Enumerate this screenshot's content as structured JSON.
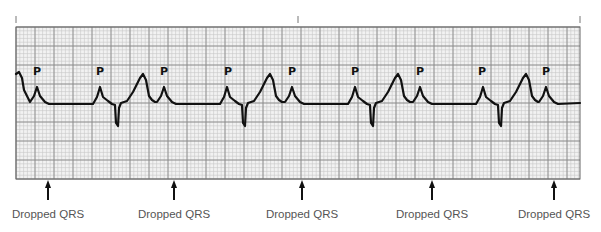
{
  "figure": {
    "p_wave_label": "P",
    "annotation_label": "Dropped QRS"
  },
  "strip": {
    "grid": {
      "x0": 16,
      "y0": 27,
      "x1": 580,
      "y1": 179,
      "minor": 3.8,
      "major": 19
    },
    "top_ticks_x": [
      16,
      298,
      580
    ],
    "p_labels": [
      {
        "x": 37,
        "text": "P"
      },
      {
        "x": 100,
        "text": "P"
      },
      {
        "x": 164,
        "text": "P"
      },
      {
        "x": 228,
        "text": "P"
      },
      {
        "x": 292,
        "text": "P"
      },
      {
        "x": 355,
        "text": "P"
      },
      {
        "x": 420,
        "text": "P"
      },
      {
        "x": 482,
        "text": "P"
      },
      {
        "x": 546,
        "text": "P"
      }
    ],
    "dropped_qrs": [
      {
        "x": 48,
        "text": "Dropped QRS"
      },
      {
        "x": 174,
        "text": "Dropped QRS"
      },
      {
        "x": 302,
        "text": "Dropped QRS"
      },
      {
        "x": 432,
        "text": "Dropped QRS"
      },
      {
        "x": 554,
        "text": "Dropped QRS"
      }
    ]
  },
  "colors": {
    "grid_minor": "#c8c8c8",
    "grid_major": "#8a8a8a",
    "grid_bg": "#f2f2f2",
    "trace": "#111111",
    "label": "#555555"
  }
}
